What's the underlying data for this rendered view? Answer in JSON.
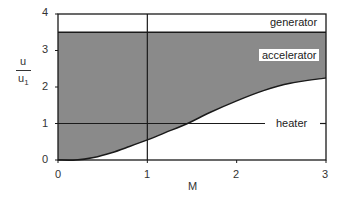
{
  "chart_data": {
    "type": "area",
    "title": "",
    "xlabel": "M",
    "ylabel": "u / u1",
    "ylabel_numerator": "u",
    "ylabel_denominator": "u",
    "ylabel_denominator_subscript": "1",
    "xlim": [
      0,
      3
    ],
    "ylim": [
      0,
      4
    ],
    "x_ticks": [
      0,
      1,
      2,
      3
    ],
    "y_ticks": [
      0,
      1,
      2,
      3,
      4
    ],
    "x_tick_labels": [
      "0",
      "1",
      "2",
      "3"
    ],
    "y_tick_labels": [
      "0",
      "1",
      "2",
      "3",
      "4"
    ],
    "grid": false,
    "regions": [
      {
        "name": "generator",
        "label": "generator",
        "description": "white band above u/u1 ≈ 3.5"
      },
      {
        "name": "accelerator",
        "label": "accelerator",
        "description": "shaded region between lower curve and u/u1 ≈ 3.5"
      },
      {
        "name": "heater",
        "label": "heater",
        "description": "white region below the curve"
      }
    ],
    "upper_boundary": {
      "y": 3.5
    },
    "reference_lines": [
      {
        "orientation": "horizontal",
        "value": 1
      },
      {
        "orientation": "vertical",
        "value": 1
      }
    ],
    "lower_curve": {
      "x": [
        0,
        0.2,
        0.4,
        0.6,
        0.8,
        1.0,
        1.2,
        1.45,
        1.7,
        2.0,
        2.3,
        2.6,
        3.0
      ],
      "y": [
        0,
        0.0,
        0.07,
        0.2,
        0.37,
        0.55,
        0.75,
        1.0,
        1.3,
        1.62,
        1.9,
        2.1,
        2.25
      ]
    },
    "colors": {
      "shaded": "#8a8a8a",
      "background": "#ffffff",
      "line": "#1a1a1a"
    }
  }
}
